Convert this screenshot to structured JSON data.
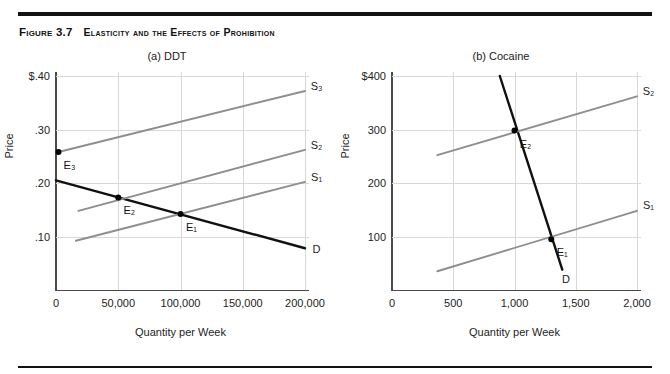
{
  "figure": {
    "number": "Figure 3.7",
    "title": "Elasticity and the Effects of Prohibition"
  },
  "chart_data": [
    {
      "type": "line",
      "panel_id": "a",
      "title": "(a) DDT",
      "xlabel": "Quantity per Week",
      "ylabel": "Price",
      "xlim": [
        0,
        200000
      ],
      "ylim": [
        0,
        0.4
      ],
      "grid": true,
      "legend_position": "curve-end-labels",
      "xticks": [
        {
          "value": 0,
          "label": "0"
        },
        {
          "value": 50000,
          "label": "50,000"
        },
        {
          "value": 100000,
          "label": "100,000"
        },
        {
          "value": 150000,
          "label": "150,000"
        },
        {
          "value": 200000,
          "label": "200,000"
        }
      ],
      "yticks": [
        {
          "value": 0.1,
          "label": ".10"
        },
        {
          "value": 0.2,
          "label": ".20"
        },
        {
          "value": 0.3,
          "label": ".30"
        },
        {
          "value": 0.4,
          "label": "$.40"
        }
      ],
      "series": [
        {
          "name": "D",
          "role": "demand",
          "label": "D",
          "color": "#111111",
          "points": [
            [
              0,
              0.205
            ],
            [
              200000,
              0.078
            ]
          ]
        },
        {
          "name": "S1",
          "role": "supply",
          "label": "S₁",
          "color": "#8e8e8e",
          "points": [
            [
              16000,
              0.092
            ],
            [
              200000,
              0.202
            ]
          ]
        },
        {
          "name": "S2",
          "role": "supply",
          "label": "S₂",
          "color": "#8e8e8e",
          "points": [
            [
              18000,
              0.148
            ],
            [
              200000,
              0.262
            ]
          ]
        },
        {
          "name": "S3",
          "role": "supply",
          "label": "S₃",
          "color": "#8e8e8e",
          "points": [
            [
              2000,
              0.258
            ],
            [
              200000,
              0.372
            ]
          ]
        }
      ],
      "equilibria": [
        {
          "label": "E₁",
          "x": 100000,
          "y": 0.142
        },
        {
          "label": "E₂",
          "x": 50000,
          "y": 0.173
        },
        {
          "label": "E₃",
          "x": 2000,
          "y": 0.258
        }
      ]
    },
    {
      "type": "line",
      "panel_id": "b",
      "title": "(b) Cocaine",
      "xlabel": "Quantity per Week",
      "ylabel": "Price",
      "xlim": [
        0,
        2000
      ],
      "ylim": [
        0,
        400
      ],
      "grid": true,
      "legend_position": "curve-end-labels",
      "xticks": [
        {
          "value": 0,
          "label": "0"
        },
        {
          "value": 500,
          "label": "500"
        },
        {
          "value": 1000,
          "label": "1,000"
        },
        {
          "value": 1500,
          "label": "1,500"
        },
        {
          "value": 2000,
          "label": "2,000"
        }
      ],
      "yticks": [
        {
          "value": 100,
          "label": "100"
        },
        {
          "value": 200,
          "label": "200"
        },
        {
          "value": 300,
          "label": "300"
        },
        {
          "value": 400,
          "label": "$400"
        }
      ],
      "series": [
        {
          "name": "D",
          "role": "demand",
          "label": "D",
          "color": "#111111",
          "points": [
            [
              880,
              400
            ],
            [
              1390,
              38
            ]
          ]
        },
        {
          "name": "S1",
          "role": "supply",
          "label": "S₁",
          "color": "#8e8e8e",
          "points": [
            [
              370,
              35
            ],
            [
              2000,
              148
            ]
          ]
        },
        {
          "name": "S2",
          "role": "supply",
          "label": "S₂",
          "color": "#8e8e8e",
          "points": [
            [
              370,
              252
            ],
            [
              2000,
              362
            ]
          ]
        }
      ],
      "equilibria": [
        {
          "label": "E₁",
          "x": 1300,
          "y": 95
        },
        {
          "label": "E₂",
          "x": 1000,
          "y": 298
        }
      ]
    }
  ]
}
